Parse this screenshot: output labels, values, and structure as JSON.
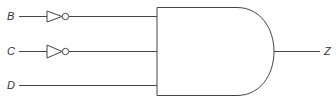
{
  "diagram": {
    "type": "logic-circuit",
    "gate": "AND",
    "inputs": [
      {
        "label": "B",
        "inverted": true
      },
      {
        "label": "C",
        "inverted": true
      },
      {
        "label": "D",
        "inverted": false
      }
    ],
    "output": {
      "label": "Z"
    }
  }
}
